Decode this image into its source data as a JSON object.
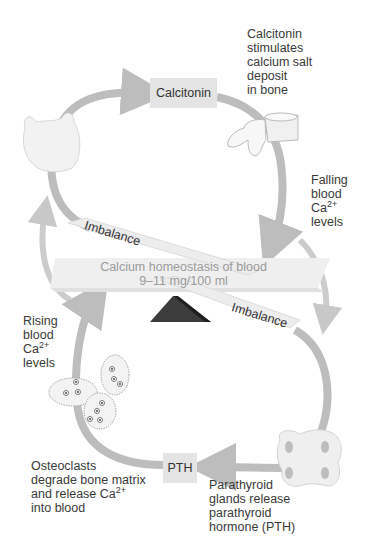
{
  "diagram": {
    "title": "Calcium homeostasis of blood",
    "center": {
      "line1": "Calcium homeostasis of blood",
      "line2": "9–11 mg/100 ml"
    },
    "imbalance_top": "Imbalance",
    "imbalance_bottom": "Imbalance",
    "hormones": {
      "calcitonin": "Calcitonin",
      "pth": "PTH"
    },
    "labels": {
      "calcitonin_effect": [
        "Calcitonin",
        "stimulates",
        "calcium salt",
        "deposit",
        "in bone"
      ],
      "falling": {
        "l1": "Falling",
        "l2": "blood",
        "l3_base": "Ca",
        "l3_sup": "2+",
        "l4": "levels"
      },
      "rising": {
        "l1": "Rising",
        "l2": "blood",
        "l3_base": "Ca",
        "l3_sup": "2+",
        "l4": "levels"
      },
      "osteoclasts": {
        "l1": "Osteoclasts",
        "l2": "degrade bone matrix",
        "l3_base": "and release Ca",
        "l3_sup": "2+",
        "l4": "into blood"
      },
      "parathyroid": [
        "Parathyroid",
        "glands release",
        "parathyroid",
        "hormone (PTH)"
      ]
    },
    "icons": {
      "thyroid": "thyroid-gland",
      "bone": "vertebra-bone",
      "osteoclasts": "osteoclast-cells",
      "parathyroid": "parathyroid-glands",
      "fulcrum": "seesaw-fulcrum"
    },
    "colors": {
      "arrow": "#b8b8b8",
      "box": "#e4e4e4",
      "fulcrum": "#3c3c3c",
      "seesaw": "#ececec"
    }
  }
}
